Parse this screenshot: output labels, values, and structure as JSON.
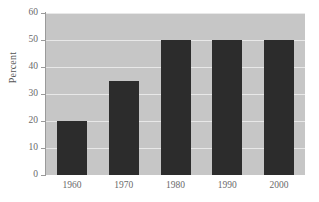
{
  "chart_data": {
    "type": "bar",
    "title": "",
    "subtitle": "",
    "xlabel": "",
    "ylabel": "Percent",
    "categories": [
      "1960",
      "1970",
      "1980",
      "1990",
      "2000"
    ],
    "values": [
      20,
      35,
      50,
      50,
      50
    ],
    "ylim": [
      0,
      60
    ],
    "yticks": [
      0,
      10,
      20,
      30,
      40,
      50,
      60
    ],
    "ytick_labels": [
      "0",
      "10",
      "20",
      "30",
      "40",
      "50",
      "60"
    ],
    "grid": true,
    "legend": null,
    "legend_position": "none",
    "annotations": [],
    "colors": {
      "bar": "#2c2c2c",
      "plot_background": "#c6c6c6",
      "figure_background": "#ffffff",
      "gridline": "#e8e8e8",
      "axis": "#9a9a9a",
      "tick_label": "#6a6a6a",
      "axis_label": "#555555"
    }
  }
}
